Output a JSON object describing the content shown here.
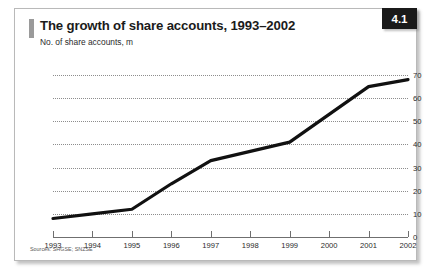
{
  "figure": {
    "badge_number": "4.1",
    "title": "The growth of share accounts, 1993–2002",
    "subtitle": "No. of share accounts, m",
    "source_note": "Sources: SHGSE; SNZSE"
  },
  "colors": {
    "badge_background": "#1a1a1a",
    "badge_text": "#ffffff",
    "accent_bar": "#9a9a9a",
    "line": "#111111",
    "gridline": "#8d8d8d",
    "axis": "#6f6f6f",
    "card_border": "#b9b9b9",
    "background": "#ffffff"
  },
  "chart_data": {
    "type": "line",
    "title": "The growth of share accounts, 1993–2002",
    "subtitle": "No. of share accounts, m",
    "xlabel": "",
    "ylabel": "No. of share accounts, m",
    "categories": [
      "1993",
      "1994",
      "1995",
      "1996",
      "1997",
      "1998",
      "1999",
      "2000",
      "2001",
      "2002"
    ],
    "values": [
      8,
      10,
      12,
      23,
      33,
      37,
      41,
      53,
      65,
      68
    ],
    "series": [
      {
        "name": "No. of share accounts, m",
        "values": [
          8,
          10,
          12,
          23,
          33,
          37,
          41,
          53,
          65,
          68
        ]
      }
    ],
    "ylim": [
      0,
      70
    ],
    "yticks": [
      0,
      10,
      20,
      30,
      40,
      50,
      60,
      70
    ],
    "ytick_labels": [
      "0",
      "10",
      "20",
      "30",
      "40",
      "50",
      "60",
      "70"
    ],
    "xtick_labels": [
      "1993",
      "1994",
      "1995",
      "1996",
      "1997",
      "1998",
      "1999",
      "2000",
      "2001",
      "2002"
    ],
    "grid": true,
    "grid_style": "dotted-horizontal",
    "y_axis_position": "right",
    "legend": false,
    "legend_position": "none"
  }
}
